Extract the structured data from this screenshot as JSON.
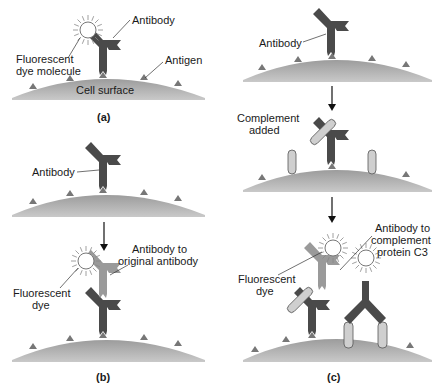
{
  "figure": {
    "panels": [
      {
        "id": "a",
        "label": "(a)",
        "texts": {
          "antibody": "Antibody",
          "dye_line1": "Fluorescent",
          "dye_line2": "dye molecule",
          "antigen": "Antigen",
          "cell_surface": "Cell surface"
        }
      },
      {
        "id": "b",
        "label": "(b)",
        "texts": {
          "antibody": "Antibody",
          "anti_antibody_line1": "Antibody to",
          "anti_antibody_line2": "original antibody",
          "dye_line1": "Fluorescent",
          "dye_line2": "dye"
        }
      },
      {
        "id": "c",
        "label": "(c)",
        "texts": {
          "antibody": "Antibody",
          "complement_line1": "Complement",
          "complement_line2": "added",
          "anti_c3_line1": "Antibody to",
          "anti_c3_line2": "complement",
          "anti_c3_line3": "protein C3",
          "dye_line1": "Fluorescent",
          "dye_line2": "dye"
        }
      }
    ],
    "colors": {
      "primary_antibody": "#4a4a4a",
      "secondary_antibody": "#9a9a9a",
      "complement": "#c8c8c8",
      "cell_surface": "#a8a8a8",
      "dye": "#ffffff",
      "text": "#1a1a1a"
    }
  }
}
